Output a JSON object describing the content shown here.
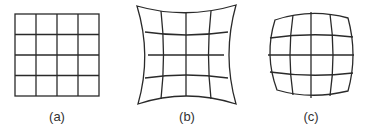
{
  "figure": {
    "panels": [
      {
        "id": "a",
        "label": "(a)",
        "description": "undistorted square grid"
      },
      {
        "id": "b",
        "label": "(b)",
        "description": "pincushion distortion grid"
      },
      {
        "id": "c",
        "label": "(c)",
        "description": "barrel distortion grid"
      }
    ],
    "grid_cells": "4x4",
    "line_color": "#2a2a2a",
    "background": "#ffffff"
  }
}
